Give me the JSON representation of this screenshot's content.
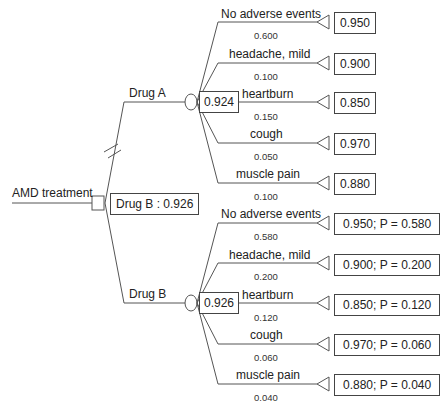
{
  "root": {
    "label": "AMD treatment",
    "decision_result": "Drug B : 0.926"
  },
  "branches": [
    {
      "name": "Drug A",
      "expected_value": "0.924",
      "pruned": true,
      "outcomes": [
        {
          "label": "No adverse events",
          "prob": "0.600",
          "value": "0.950"
        },
        {
          "label": "headache, mild",
          "prob": "0.100",
          "value": "0.900"
        },
        {
          "label": "heartburn",
          "prob": "0.150",
          "value": "0.850"
        },
        {
          "label": "cough",
          "prob": "0.050",
          "value": "0.970"
        },
        {
          "label": "muscle pain",
          "prob": "0.100",
          "value": "0.880"
        }
      ]
    },
    {
      "name": "Drug B",
      "expected_value": "0.926",
      "pruned": false,
      "outcomes": [
        {
          "label": "No adverse events",
          "prob": "0.580",
          "value": "0.950; P = 0.580"
        },
        {
          "label": "headache, mild",
          "prob": "0.200",
          "value": "0.900; P = 0.200"
        },
        {
          "label": "heartburn",
          "prob": "0.120",
          "value": "0.850; P = 0.120"
        },
        {
          "label": "cough",
          "prob": "0.060",
          "value": "0.970; P = 0.060"
        },
        {
          "label": "muscle pain",
          "prob": "0.040",
          "value": "0.880; P = 0.040"
        }
      ]
    }
  ]
}
